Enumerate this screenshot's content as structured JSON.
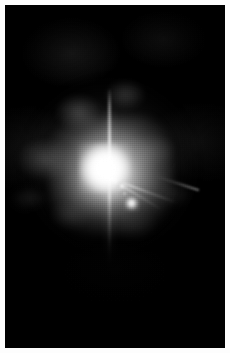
{
  "image": {
    "kind": "astronomical-photograph",
    "palette": "grayscale",
    "alt_text": "Grayscale astronomical image of a bright saturated star with diffraction spikes surrounded by mottled nebulosity, with a fainter companion point source below and to the right",
    "frame": {
      "total_width": 230,
      "total_height": 353,
      "margin_color": "#fdfdfd",
      "margin_px": 5,
      "plate_width": 220,
      "plate_height": 343,
      "background_color": "#000000"
    },
    "features": [
      {
        "id": "core",
        "label": "saturated stellar core",
        "center_x": 105,
        "center_y": 168,
        "peak_color": "#ffffff"
      },
      {
        "id": "halo",
        "label": "bright circumstellar halo",
        "center_x": 98,
        "center_y": 162,
        "radius_x": 100,
        "radius_y": 100
      },
      {
        "id": "nebulosity",
        "label": "mottled surrounding nebulosity",
        "center_x": 95,
        "center_y": 168
      },
      {
        "id": "spike-vertical",
        "label": "vertical diffraction spike",
        "top_y": 88,
        "bottom_y": 268
      },
      {
        "id": "spike-diagonal",
        "label": "diagonal diffraction spikes toward lower right",
        "origin_x": 105,
        "origin_y": 170
      },
      {
        "id": "companion",
        "label": "companion point source",
        "center_x": 131,
        "center_y": 203,
        "peak_color": "#ffffff"
      },
      {
        "id": "point-source-b",
        "label": "faint field point source",
        "center_x": 122,
        "center_y": 186
      },
      {
        "id": "point-source-c",
        "label": "faint field point source",
        "center_x": 124,
        "center_y": 193
      }
    ],
    "colors": {
      "peak": "#ffffff",
      "halo": "#c8c8c8",
      "nebula": "#7a7a7a",
      "sky": "#0a0a0a",
      "black": "#000000"
    }
  }
}
